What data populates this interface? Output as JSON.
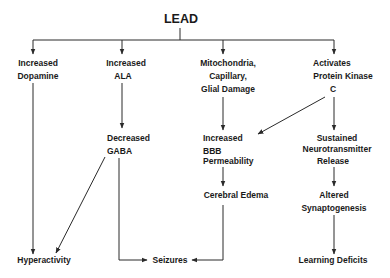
{
  "title": "LEAD",
  "nodes": {
    "dopamine": {
      "lines": [
        "Increased",
        "Dopamine"
      ]
    },
    "ala": {
      "lines": [
        "Increased",
        "ALA"
      ]
    },
    "mito": {
      "lines": [
        "Mitochondria,",
        "Capillary,",
        "Glial Damage"
      ]
    },
    "pkc": {
      "lines": [
        "Activates",
        "Protein Kinase",
        "C"
      ]
    },
    "gaba": {
      "lines": [
        "Decreased",
        "GABA"
      ]
    },
    "bbb": {
      "lines": [
        "Increased",
        "BBB",
        "Permeability"
      ]
    },
    "neuro": {
      "lines": [
        "Sustained",
        "Neurotransmitter",
        "Release"
      ]
    },
    "edema": {
      "lines": [
        "Cerebral Edema"
      ]
    },
    "synapto": {
      "lines": [
        "Altered",
        "Synaptogenesis"
      ]
    },
    "hyper": {
      "lines": [
        "Hyperactivity"
      ]
    },
    "seizures": {
      "lines": [
        "Seizures"
      ]
    },
    "learning": {
      "lines": [
        "Learning Deficits"
      ]
    }
  },
  "edges": [
    {
      "from": "LEAD",
      "to": "Increased Dopamine"
    },
    {
      "from": "LEAD",
      "to": "Increased ALA"
    },
    {
      "from": "LEAD",
      "to": "Mitochondria, Capillary, Glial Damage"
    },
    {
      "from": "LEAD",
      "to": "Activates Protein Kinase C"
    },
    {
      "from": "Increased Dopamine",
      "to": "Hyperactivity"
    },
    {
      "from": "Increased ALA",
      "to": "Decreased GABA"
    },
    {
      "from": "Decreased GABA",
      "to": "Hyperactivity"
    },
    {
      "from": "Decreased GABA",
      "to": "Seizures"
    },
    {
      "from": "Mitochondria, Capillary, Glial Damage",
      "to": "Increased BBB Permeability"
    },
    {
      "from": "Activates Protein Kinase C",
      "to": "Increased BBB Permeability"
    },
    {
      "from": "Activates Protein Kinase C",
      "to": "Sustained Neurotransmitter Release"
    },
    {
      "from": "Increased BBB Permeability",
      "to": "Cerebral Edema"
    },
    {
      "from": "Cerebral Edema",
      "to": "Seizures"
    },
    {
      "from": "Sustained Neurotransmitter Release",
      "to": "Altered Synaptogenesis"
    },
    {
      "from": "Altered Synaptogenesis",
      "to": "Learning Deficits"
    }
  ]
}
